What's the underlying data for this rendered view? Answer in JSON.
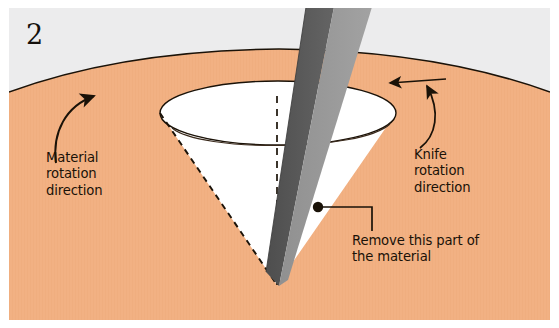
{
  "figure": {
    "panel_number": "2",
    "caption_labels": {
      "material_rotation": "Material\nrotation\ndirection",
      "knife_rotation": "Knife\nrotation\ndirection",
      "remove_part": "Remove this part of\nthe material"
    },
    "colors": {
      "background_gray": "#ececed",
      "material_orange": "#f2b183",
      "material_orange_shade": "#eda87a",
      "cut_white": "#ffffff",
      "blade_dark": "#585858",
      "blade_light": "#8d8d8d",
      "ink": "#1a1208",
      "frame_white": "#ffffff"
    },
    "elements": {
      "material_body": "material-body",
      "cone_cut": "cone-cut",
      "cone_rim": "cone-rim-ellipse",
      "cone_axis": "cone-center-axis-dashed",
      "cone_left_edge": "cone-left-slant-dashed",
      "knife_blade": "knife-blade",
      "material_rotation_arrow": "material-rotation-arrow",
      "rim_direction_arrow": "rim-direction-arrow",
      "knife_rotation_arrow": "knife-rotation-arrow",
      "leader_line": "remove-part-leader-line",
      "leader_dot": "remove-part-leader-dot"
    },
    "geometry": {
      "rim_center_x": 278,
      "rim_center_y": 113,
      "rim_radius_x": 118,
      "rim_radius_y": 32,
      "cone_apex_x": 277,
      "cone_apex_y": 285
    }
  }
}
